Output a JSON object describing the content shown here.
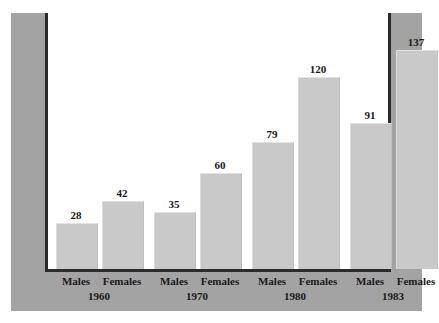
{
  "chart_data": {
    "type": "bar",
    "title": "",
    "subtitle": "",
    "xlabel": "",
    "ylabel": "",
    "grid": false,
    "legend": "none",
    "ylim": [
      0,
      145
    ],
    "categories": [
      "1960",
      "1970",
      "1980",
      "1983"
    ],
    "series": [
      {
        "name": "Males",
        "values": [
          28,
          35,
          79,
          91
        ]
      },
      {
        "name": "Females",
        "values": [
          42,
          60,
          120,
          137
        ]
      }
    ],
    "bars": [
      {
        "group": "1960",
        "series": "Males",
        "value": 28,
        "value_label": "28",
        "series_label": "Males"
      },
      {
        "group": "1960",
        "series": "Females",
        "value": 42,
        "value_label": "42",
        "series_label": "Females"
      },
      {
        "group": "1970",
        "series": "Males",
        "value": 35,
        "value_label": "35",
        "series_label": "Males"
      },
      {
        "group": "1970",
        "series": "Females",
        "value": 60,
        "value_label": "60",
        "series_label": "Females"
      },
      {
        "group": "1980",
        "series": "Males",
        "value": 79,
        "value_label": "79",
        "series_label": "Males"
      },
      {
        "group": "1980",
        "series": "Females",
        "value": 120,
        "value_label": "120",
        "series_label": "Females"
      },
      {
        "group": "1983",
        "series": "Males",
        "value": 91,
        "value_label": "91",
        "series_label": "Males"
      },
      {
        "group": "1983",
        "series": "Females",
        "value": 137,
        "value_label": "137",
        "series_label": "Females"
      }
    ],
    "group_labels": [
      "1960",
      "1970",
      "1980",
      "1983"
    ],
    "colors": {
      "bar_fill": "#c9c9c9",
      "panel_background": "#a3a3a3",
      "plot_background": "#ffffff",
      "axis_line": "#2c2c2c",
      "text": "#1a1a1a"
    }
  }
}
